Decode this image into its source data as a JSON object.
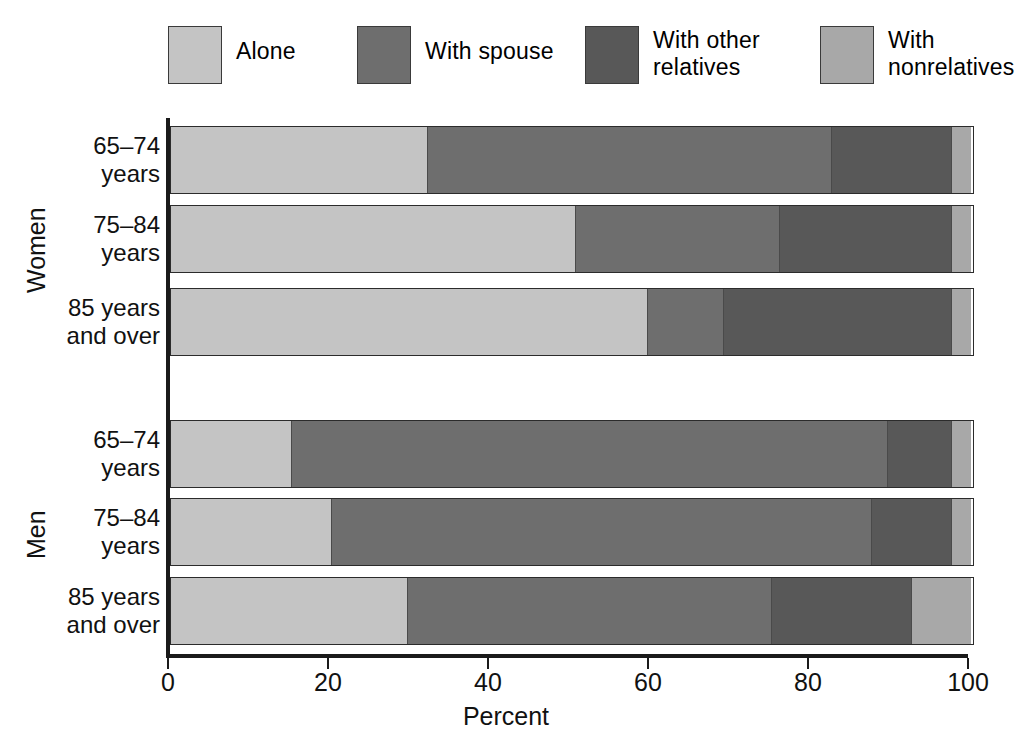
{
  "legend": {
    "items": [
      {
        "label": "Alone",
        "color": "#c4c4c4",
        "icon": "legend-swatch-alone"
      },
      {
        "label": "With spouse",
        "color": "#6e6e6e",
        "icon": "legend-swatch-with-spouse"
      },
      {
        "label": "With other\nrelatives",
        "color": "#585858",
        "icon": "legend-swatch-with-other-relatives"
      },
      {
        "label": "With\nnonrelatives",
        "color": "#a8a8a8",
        "icon": "legend-swatch-with-nonrelatives"
      }
    ]
  },
  "axis": {
    "x_title": "Percent",
    "x_ticks": [
      "0",
      "20",
      "40",
      "60",
      "80",
      "100"
    ]
  },
  "groups": [
    {
      "name": "Women"
    },
    {
      "name": "Men"
    }
  ],
  "rows": [
    {
      "label": "65–74\nyears",
      "group": "Women"
    },
    {
      "label": "75–84\nyears",
      "group": "Women"
    },
    {
      "label": "85 years\nand over",
      "group": "Women"
    },
    {
      "label": "65–74\nyears",
      "group": "Men"
    },
    {
      "label": "75–84\nyears",
      "group": "Men"
    },
    {
      "label": "85 years\nand over",
      "group": "Men"
    }
  ],
  "chart_data": {
    "type": "bar",
    "orientation": "horizontal",
    "stacked": true,
    "title": "",
    "xlabel": "Percent",
    "ylabel": "",
    "xlim": [
      0,
      100
    ],
    "xticks": [
      0,
      20,
      40,
      60,
      80,
      100
    ],
    "grid": false,
    "legend_position": "top",
    "categories": [
      "Women 65–74 years",
      "Women 75–84 years",
      "Women 85 years and over",
      "Men 65–74 years",
      "Men 75–84 years",
      "Men 85 years and over"
    ],
    "series": [
      {
        "name": "Alone",
        "color": "#c4c4c4",
        "values": [
          32.0,
          50.5,
          59.5,
          15.0,
          20.0,
          29.5
        ]
      },
      {
        "name": "With spouse",
        "color": "#6e6e6e",
        "values": [
          50.5,
          25.5,
          9.5,
          74.5,
          67.5,
          45.5
        ]
      },
      {
        "name": "With other relatives",
        "color": "#585858",
        "values": [
          15.0,
          21.5,
          28.5,
          8.0,
          10.0,
          17.5
        ]
      },
      {
        "name": "With nonrelatives",
        "color": "#a8a8a8",
        "values": [
          2.5,
          2.5,
          2.5,
          2.5,
          2.5,
          7.5
        ]
      }
    ]
  }
}
